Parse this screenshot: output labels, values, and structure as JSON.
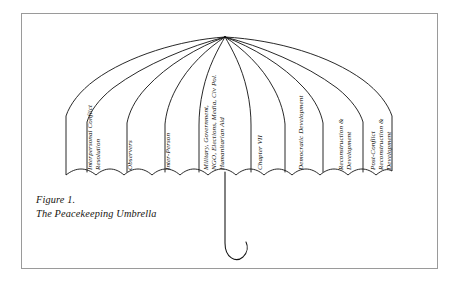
{
  "figure": {
    "caption_number": "Figure 1.",
    "caption_title": "The Peacekeeping Umbrella",
    "frame_color": "#9a9a9a",
    "ink_color": "#111111",
    "background_color": "#ffffff"
  },
  "diagram": {
    "type": "umbrella-concept-diagram",
    "subject": "Peacekeeping Umbrella",
    "panel_count": 8,
    "apex_label": "umbrella-apex",
    "handle_label": "umbrella-handle"
  },
  "panels": [
    {
      "id": "interpersonal-conflict-resolution",
      "lines": [
        "Interpersonal Conflict",
        "Resolution"
      ],
      "x": 86,
      "y": 170,
      "tilt": -6
    },
    {
      "id": "observers",
      "lines": [
        "Observers"
      ],
      "x": 124,
      "y": 170,
      "tilt": -3
    },
    {
      "id": "inter-person",
      "lines": [
        "Inter-Person"
      ],
      "x": 162,
      "y": 170,
      "tilt": -1
    },
    {
      "id": "military-government-ngo",
      "lines": [
        "Military, Government,",
        "NGO, Elections, Media, Civ Pol.",
        "Humanitarian Aid"
      ],
      "x": 202,
      "y": 170,
      "tilt": 0
    },
    {
      "id": "chapter-vii",
      "lines": [
        "Chapter VII"
      ],
      "x": 254,
      "y": 170,
      "tilt": 1
    },
    {
      "id": "democratic-development",
      "lines": [
        "Democratic Development"
      ],
      "x": 297,
      "y": 170,
      "tilt": 3
    },
    {
      "id": "reconstruction-development",
      "lines": [
        "Reconstruction &",
        "Development"
      ],
      "x": 338,
      "y": 170,
      "tilt": 5
    },
    {
      "id": "post-conflict-reconstruction-development",
      "lines": [
        "Post-Conflict",
        "Reconstruction &",
        "Development"
      ],
      "x": 372,
      "y": 170,
      "tilt": 7
    }
  ]
}
